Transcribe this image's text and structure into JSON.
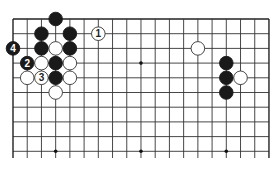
{
  "diagram": {
    "type": "go-board-diagram",
    "grid": {
      "columns": 19,
      "visible_rows": 10,
      "origin_x": 13,
      "origin_y": 19,
      "spacing_x": 14.22,
      "spacing_y": 14.7,
      "line_bottom_y": 158,
      "line_color": "#333333",
      "edge_color": "#222222"
    },
    "star_points": [
      {
        "col": 9,
        "row": 3
      },
      {
        "col": 3,
        "row": 9
      },
      {
        "col": 9,
        "row": 9
      },
      {
        "col": 15,
        "row": 9
      }
    ],
    "stones": [
      {
        "color": "black",
        "col": 3,
        "row": 0,
        "label": ""
      },
      {
        "color": "black",
        "col": 2,
        "row": 1,
        "label": ""
      },
      {
        "color": "black",
        "col": 4,
        "row": 1,
        "label": ""
      },
      {
        "color": "white",
        "col": 6,
        "row": 1,
        "label": "1"
      },
      {
        "color": "black",
        "col": 0,
        "row": 2,
        "label": "4"
      },
      {
        "color": "black",
        "col": 2,
        "row": 2,
        "label": ""
      },
      {
        "color": "white",
        "col": 3,
        "row": 2,
        "label": ""
      },
      {
        "color": "black",
        "col": 4,
        "row": 2,
        "label": ""
      },
      {
        "color": "black",
        "col": 1,
        "row": 3,
        "label": "2"
      },
      {
        "color": "white",
        "col": 2,
        "row": 3,
        "label": ""
      },
      {
        "color": "black",
        "col": 3,
        "row": 3,
        "label": ""
      },
      {
        "color": "white",
        "col": 4,
        "row": 3,
        "label": ""
      },
      {
        "color": "white",
        "col": 1,
        "row": 4,
        "label": ""
      },
      {
        "color": "white",
        "col": 2,
        "row": 4,
        "label": "3"
      },
      {
        "color": "black",
        "col": 3,
        "row": 4,
        "label": ""
      },
      {
        "color": "white",
        "col": 4,
        "row": 4,
        "label": ""
      },
      {
        "color": "white",
        "col": 3,
        "row": 5,
        "label": ""
      },
      {
        "color": "white",
        "col": 13,
        "row": 2,
        "label": ""
      },
      {
        "color": "black",
        "col": 15,
        "row": 3,
        "label": ""
      },
      {
        "color": "black",
        "col": 15,
        "row": 4,
        "label": ""
      },
      {
        "color": "white",
        "col": 16,
        "row": 4,
        "label": ""
      },
      {
        "color": "black",
        "col": 15,
        "row": 5,
        "label": ""
      }
    ],
    "colors": {
      "black_stone": "#1a1a1a",
      "white_stone": "#ffffff",
      "white_stroke": "#333333",
      "label_on_black": "#ffffff",
      "label_on_white": "#222222"
    }
  }
}
